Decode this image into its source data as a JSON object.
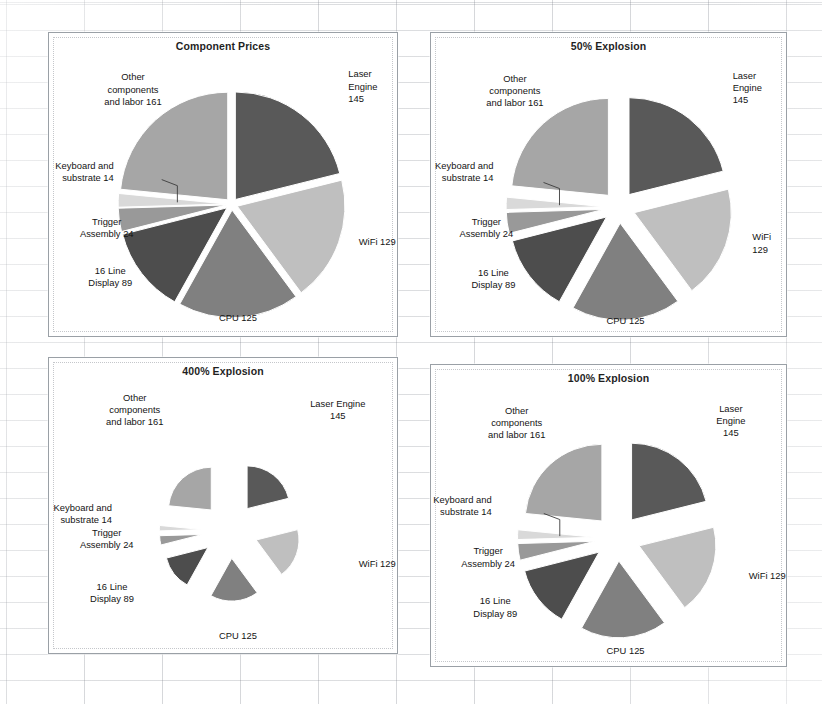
{
  "document": {
    "background": "spreadsheet-grid",
    "paper_color": "#ffffff"
  },
  "palette": {
    "laser_engine": "#595959",
    "wifi": "#bfbfbf",
    "cpu": "#808080",
    "display_16_line": "#4d4d4d",
    "trigger_assembly": "#999999",
    "keyboard_substrate": "#d9d9d9",
    "other_components": "#a6a6a6",
    "panel_border": "#9aa0a6",
    "text": "#141414"
  },
  "chart_data": [
    {
      "id": "component-prices",
      "type": "pie",
      "title": "Component Prices",
      "explosion_percent": 0,
      "explosion_label": "0%",
      "start_angle_deg": 0,
      "total": 687,
      "categories": [
        "Laser Engine",
        "WiFi",
        "CPU",
        "16 Line Display",
        "Trigger Assembly",
        "Keyboard and substrate",
        "Other components and labor"
      ],
      "values": [
        145,
        129,
        125,
        89,
        24,
        14,
        161
      ],
      "labels": [
        "Laser Engine\n145",
        "WiFi 129",
        "CPU 125",
        "16 Line\nDisplay 89",
        "Trigger\nAssembly 24",
        "Keyboard and\nsubstrate 14",
        "Other\ncomponents\nand labor 161"
      ],
      "colors": [
        "#595959",
        "#bfbfbf",
        "#808080",
        "#4d4d4d",
        "#999999",
        "#d9d9d9",
        "#a6a6a6"
      ],
      "legend": "none",
      "grid": false
    },
    {
      "id": "explosion-50",
      "type": "pie",
      "title": "50% Explosion",
      "explosion_percent": 50,
      "explosion_label": "50%",
      "start_angle_deg": 0,
      "total": 687,
      "categories": [
        "Laser Engine",
        "WiFi",
        "CPU",
        "16 Line Display",
        "Trigger Assembly",
        "Keyboard and substrate",
        "Other components and labor"
      ],
      "values": [
        145,
        129,
        125,
        89,
        24,
        14,
        161
      ],
      "labels": [
        "Laser Engine\n145",
        "WiFi 129",
        "CPU 125",
        "16 Line\nDisplay 89",
        "Trigger\nAssembly 24",
        "Keyboard and\nsubstrate 14",
        "Other\ncomponents\nand labor 161"
      ],
      "colors": [
        "#595959",
        "#bfbfbf",
        "#808080",
        "#4d4d4d",
        "#999999",
        "#d9d9d9",
        "#a6a6a6"
      ],
      "legend": "none",
      "grid": false
    },
    {
      "id": "explosion-400",
      "type": "pie",
      "title": "400% Explosion",
      "explosion_percent": 400,
      "explosion_label": "400%",
      "start_angle_deg": 0,
      "total": 687,
      "categories": [
        "Laser Engine",
        "WiFi",
        "CPU",
        "16 Line Display",
        "Trigger Assembly",
        "Keyboard and substrate",
        "Other components and labor"
      ],
      "values": [
        145,
        129,
        125,
        89,
        24,
        14,
        161
      ],
      "labels": [
        "Laser Engine\n145",
        "WiFi 129",
        "CPU 125",
        "16 Line\nDisplay 89",
        "Trigger\nAssembly 24",
        "Keyboard and\nsubstrate 14",
        "Other\ncomponents\nand labor 161"
      ],
      "colors": [
        "#595959",
        "#bfbfbf",
        "#808080",
        "#4d4d4d",
        "#999999",
        "#d9d9d9",
        "#a6a6a6"
      ],
      "legend": "none",
      "grid": false
    },
    {
      "id": "explosion-100",
      "type": "pie",
      "title": "100% Explosion",
      "explosion_percent": 100,
      "explosion_label": "100%",
      "start_angle_deg": 0,
      "total": 687,
      "categories": [
        "Laser Engine",
        "WiFi",
        "CPU",
        "16 Line Display",
        "Trigger Assembly",
        "Keyboard and substrate",
        "Other components and labor"
      ],
      "values": [
        145,
        129,
        125,
        89,
        24,
        14,
        161
      ],
      "labels": [
        "Laser Engine\n145",
        "WiFi 129",
        "CPU 125",
        "16 Line\nDisplay 89",
        "Trigger\nAssembly 24",
        "Keyboard and\nsubstrate 14",
        "Other\ncomponents\nand labor 161"
      ],
      "colors": [
        "#595959",
        "#bfbfbf",
        "#808080",
        "#4d4d4d",
        "#999999",
        "#d9d9d9",
        "#a6a6a6"
      ],
      "legend": "none",
      "grid": false
    }
  ],
  "layout": {
    "panels": [
      {
        "cx": 0.525,
        "cy": 0.565,
        "r": 0.355,
        "explode": 0.055,
        "leader": true,
        "label_pos": [
          {
            "x": 0.855,
            "y": 0.175,
            "align": "left"
          },
          {
            "x": 0.885,
            "y": 0.685,
            "align": "left"
          },
          {
            "x": 0.54,
            "y": 0.935,
            "align": "center"
          },
          {
            "x": 0.175,
            "y": 0.8,
            "align": "center"
          },
          {
            "x": 0.165,
            "y": 0.64,
            "align": "center"
          },
          {
            "x": 0.185,
            "y": 0.455,
            "align": "right"
          },
          {
            "x": 0.24,
            "y": 0.185,
            "align": "center"
          }
        ]
      },
      {
        "cx": 0.53,
        "cy": 0.575,
        "r": 0.32,
        "explode": 0.165,
        "leader": true,
        "label_pos": [
          {
            "x": 0.845,
            "y": 0.18,
            "align": "left"
          },
          {
            "x": 0.9,
            "y": 0.69,
            "align": "left"
          },
          {
            "x": 0.545,
            "y": 0.945,
            "align": "center"
          },
          {
            "x": 0.175,
            "y": 0.805,
            "align": "center"
          },
          {
            "x": 0.155,
            "y": 0.64,
            "align": "center"
          },
          {
            "x": 0.175,
            "y": 0.455,
            "align": "right"
          },
          {
            "x": 0.235,
            "y": 0.19,
            "align": "center"
          }
        ]
      },
      {
        "cx": 0.52,
        "cy": 0.585,
        "r": 0.145,
        "explode": 0.65,
        "leader": false,
        "label_pos": [
          {
            "x": 0.825,
            "y": 0.175,
            "align": "center"
          },
          {
            "x": 0.885,
            "y": 0.695,
            "align": "left"
          },
          {
            "x": 0.54,
            "y": 0.935,
            "align": "center"
          },
          {
            "x": 0.18,
            "y": 0.79,
            "align": "center"
          },
          {
            "x": 0.165,
            "y": 0.61,
            "align": "center"
          },
          {
            "x": 0.18,
            "y": 0.525,
            "align": "right"
          },
          {
            "x": 0.245,
            "y": 0.175,
            "align": "center"
          }
        ]
      },
      {
        "cx": 0.525,
        "cy": 0.575,
        "r": 0.255,
        "explode": 0.3,
        "leader": true,
        "label_pos": [
          {
            "x": 0.84,
            "y": 0.185,
            "align": "center"
          },
          {
            "x": 0.89,
            "y": 0.695,
            "align": "left"
          },
          {
            "x": 0.545,
            "y": 0.945,
            "align": "center"
          },
          {
            "x": 0.18,
            "y": 0.8,
            "align": "center"
          },
          {
            "x": 0.16,
            "y": 0.635,
            "align": "center"
          },
          {
            "x": 0.17,
            "y": 0.465,
            "align": "right"
          },
          {
            "x": 0.24,
            "y": 0.19,
            "align": "center"
          }
        ]
      }
    ]
  }
}
